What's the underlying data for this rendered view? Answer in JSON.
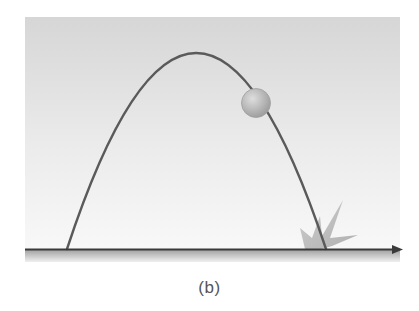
{
  "figure": {
    "caption": "(b)",
    "colors": {
      "background_top": "#d6d6d6",
      "background_bottom": "#f7f7f7",
      "trajectory": "#5a5a5a",
      "ball": "#b4b4b4",
      "ball_highlight": "#dcdcdc",
      "ground_axis": "#3a3a3a",
      "ground_shadow": "#a8a8a8",
      "impact_burst": "#b8b8b8"
    },
    "panel": {
      "x": 25,
      "y": 17,
      "width": 375,
      "height": 245
    },
    "trajectory": {
      "launch_point": [
        67,
        249
      ],
      "apex": [
        196,
        53
      ],
      "landing_point": [
        326,
        249
      ]
    },
    "ball": {
      "cx": 256,
      "cy": 103,
      "r": 14
    },
    "impact": {
      "cx": 318,
      "cy": 244
    },
    "axis": {
      "y": 249,
      "x_start": 25,
      "x_end": 403,
      "arrow": "right-arrow"
    }
  }
}
